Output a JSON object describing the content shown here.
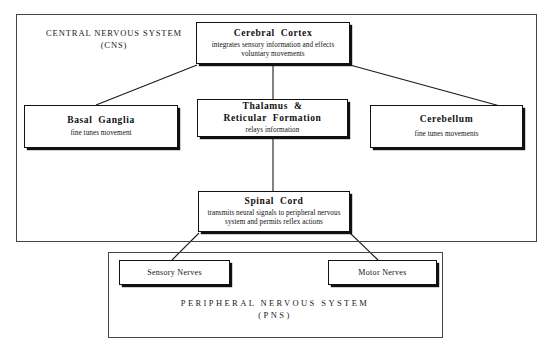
{
  "diagram": {
    "regions": [
      {
        "key": "cns",
        "name": "central-nervous-system-region",
        "label": "CENTRAL NERVOUS SYSTEM\n(CNS)"
      },
      {
        "key": "pns",
        "name": "peripheral-nervous-system-region",
        "label": "PERIPHERAL NERVOUS SYSTEM\n(PNS)"
      }
    ],
    "nodes": {
      "cortex": {
        "title": "Cerebral  Cortex",
        "desc": "integrates sensory information and effects\nvoluntary movements"
      },
      "basal_ganglia": {
        "title": "Basal  Ganglia",
        "desc": "fine tunes movement"
      },
      "thalamus": {
        "title": "Thalamus  &\nReticular  Formation",
        "desc": "relays  information"
      },
      "cerebellum": {
        "title": "Cerebellum",
        "desc": "fine tunes movements"
      },
      "spinal_cord": {
        "title": "Spinal  Cord",
        "desc": "transmits neural signals to peripheral\nnervous system and permits reflex actions"
      },
      "sensory_nerves": {
        "title": "Sensory Nerves"
      },
      "motor_nerves": {
        "title": "Motor Nerves"
      }
    },
    "connections": [
      {
        "from": "cortex",
        "to": "basal_ganglia"
      },
      {
        "from": "cortex",
        "to": "thalamus"
      },
      {
        "from": "cortex",
        "to": "cerebellum"
      },
      {
        "from": "thalamus",
        "to": "spinal_cord"
      },
      {
        "from": "spinal_cord",
        "to": "sensory_nerves"
      },
      {
        "from": "spinal_cord",
        "to": "motor_nerves"
      }
    ],
    "colors": {
      "ink": "#111111",
      "frame": "#444444",
      "background": "#ffffff"
    }
  }
}
